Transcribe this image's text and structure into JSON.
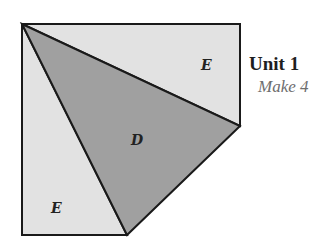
{
  "unit": {
    "title": "Unit 1",
    "subtitle": "Make 4"
  },
  "pieces": [
    {
      "label": "E",
      "fill": "#e2e2e2",
      "role": "top-right-triangle"
    },
    {
      "label": "D",
      "fill": "#a0a0a0",
      "role": "center-triangle"
    },
    {
      "label": "E",
      "fill": "#e2e2e2",
      "role": "bottom-left-triangle"
    }
  ],
  "colors": {
    "light": "#e2e2e2",
    "dark": "#a0a0a0",
    "stroke": "#1a1a1a"
  }
}
